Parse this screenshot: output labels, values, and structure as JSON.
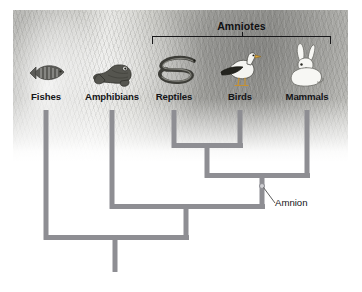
{
  "figure": {
    "kind": "cladogram",
    "clade_bracket": {
      "label": "Amniotes",
      "left_px": 152,
      "right_px": 331,
      "top_px": 36
    },
    "annotation": {
      "label": "Amnion",
      "node_x_px": 262,
      "node_y_px": 186,
      "label_x_px": 275,
      "label_y_px": 204,
      "meaning": "synapomorphy marking the amniote node"
    },
    "colors": {
      "branch": "#8e8e93",
      "bracket": "#18181a",
      "text": "#141417",
      "node_fill": "#cfcfd3"
    },
    "taxa": [
      {
        "label": "Fishes",
        "icon": "fish-icon",
        "x_px": 46,
        "tip_y_px": 110,
        "in_amniotes": false
      },
      {
        "label": "Amphibians",
        "icon": "frog-icon",
        "x_px": 112,
        "tip_y_px": 110,
        "in_amniotes": false
      },
      {
        "label": "Reptiles",
        "icon": "snake-icon",
        "x_px": 174,
        "tip_y_px": 110,
        "in_amniotes": true
      },
      {
        "label": "Birds",
        "icon": "bird-icon",
        "x_px": 240,
        "tip_y_px": 110,
        "in_amniotes": true
      },
      {
        "label": "Mammals",
        "icon": "rabbit-icon",
        "x_px": 307,
        "tip_y_px": 110,
        "in_amniotes": true
      }
    ],
    "nodes": [
      {
        "name": "reptiles-birds-node",
        "children": [
          "Reptiles",
          "Birds"
        ],
        "y_px": 145,
        "stem_x_px": 207
      },
      {
        "name": "amniote-node",
        "children": [
          "reptiles-birds-node",
          "Mammals"
        ],
        "y_px": 175,
        "stem_x_px": 262
      },
      {
        "name": "tetrapod-node",
        "children": [
          "Amphibians",
          "amniote-node"
        ],
        "y_px": 206,
        "stem_x_px": 186
      },
      {
        "name": "root-node",
        "children": [
          "Fishes",
          "tetrapod-node"
        ],
        "y_px": 237,
        "stem_x_px": 115
      }
    ],
    "root_stem_bottom_px": 272
  }
}
